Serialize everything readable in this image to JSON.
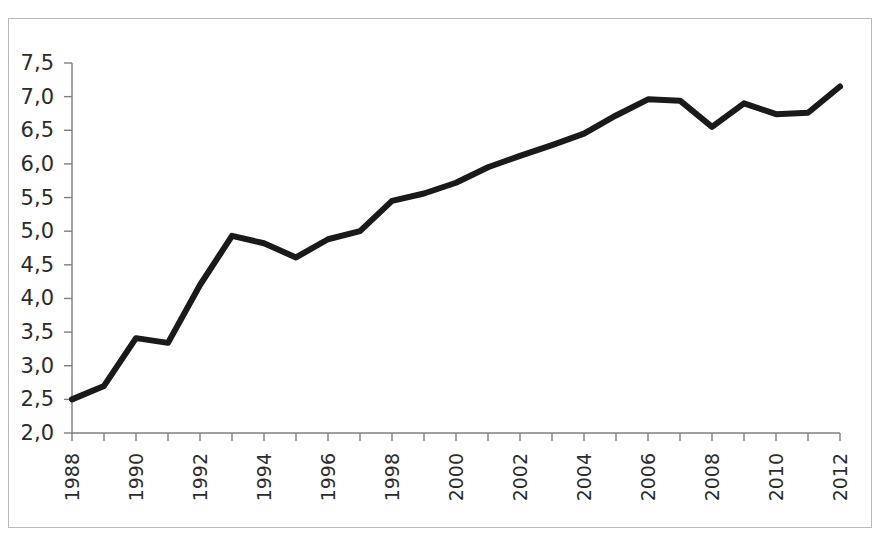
{
  "chart_data": {
    "type": "line",
    "title": "",
    "subtitle": "",
    "xlabel": "",
    "ylabel": "",
    "xlim": [
      1988,
      2012
    ],
    "ylim": [
      2.0,
      7.5
    ],
    "grid": false,
    "legend": "none",
    "decimal_separator": ",",
    "y_ticks": [
      2.0,
      2.5,
      3.0,
      3.5,
      4.0,
      4.5,
      5.0,
      5.5,
      6.0,
      6.5,
      7.0,
      7.5
    ],
    "y_tick_labels": [
      "2,0",
      "2,5",
      "3,0",
      "3,5",
      "4,0",
      "4,5",
      "5,0",
      "5,5",
      "6,0",
      "6,5",
      "7,0",
      "7,5"
    ],
    "x_ticks": [
      1988,
      1989,
      1990,
      1991,
      1992,
      1993,
      1994,
      1995,
      1996,
      1997,
      1998,
      1999,
      2000,
      2001,
      2002,
      2003,
      2004,
      2005,
      2006,
      2007,
      2008,
      2009,
      2010,
      2011,
      2012
    ],
    "x_tick_labels": [
      "1988",
      "",
      "1990",
      "",
      "1992",
      "",
      "1994",
      "",
      "1996",
      "",
      "1998",
      "",
      "2000",
      "",
      "2002",
      "",
      "2004",
      "",
      "2006",
      "",
      "2008",
      "",
      "2010",
      "",
      "2012"
    ],
    "x_tick_label_rotation": -90,
    "categories": [
      1988,
      1989,
      1990,
      1991,
      1992,
      1993,
      1994,
      1995,
      1996,
      1997,
      1998,
      1999,
      2000,
      2001,
      2002,
      2003,
      2004,
      2005,
      2006,
      2007,
      2008,
      2009,
      2010,
      2011,
      2012
    ],
    "values": [
      2.5,
      2.7,
      3.41,
      3.34,
      4.2,
      4.93,
      4.82,
      4.61,
      4.88,
      5.0,
      5.45,
      5.56,
      5.72,
      5.95,
      6.12,
      6.28,
      6.45,
      6.72,
      6.96,
      6.94,
      6.55,
      6.9,
      6.74,
      6.76,
      7.15
    ],
    "series": [
      {
        "name": "series-1",
        "color": "#1a1a1a",
        "line_width": 6,
        "values": [
          2.5,
          2.7,
          3.41,
          3.34,
          4.2,
          4.93,
          4.82,
          4.61,
          4.88,
          5.0,
          5.45,
          5.56,
          5.72,
          5.95,
          6.12,
          6.28,
          6.45,
          6.72,
          6.96,
          6.94,
          6.55,
          6.9,
          6.74,
          6.76,
          7.15
        ]
      }
    ]
  },
  "frame": {
    "border_color": "#b9b9b9",
    "background": "#ffffff"
  },
  "axes": {
    "axis_color": "#7f7f7f",
    "label_color": "#2b2b2b"
  }
}
